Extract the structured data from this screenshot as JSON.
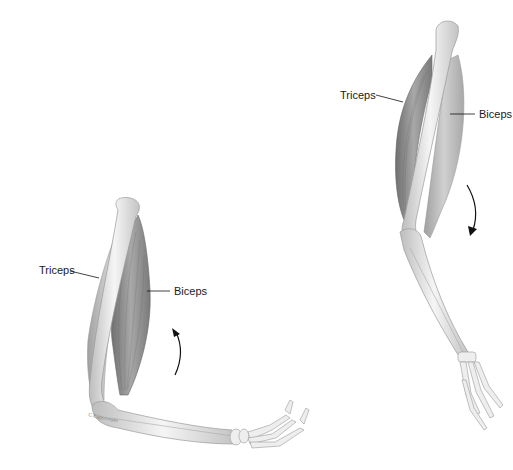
{
  "figure": {
    "left_panel": {
      "state": "flexed",
      "labels": {
        "triceps": "Triceps",
        "biceps": "Biceps"
      },
      "arrow_direction": "up",
      "signature": "C.Eggemeyer"
    },
    "right_panel": {
      "state": "extended",
      "labels": {
        "triceps": "Triceps",
        "biceps": "Biceps"
      },
      "arrow_direction": "down"
    }
  },
  "colors": {
    "bone": "#ececec",
    "bone_outline": "#9a9a9a",
    "muscle": "#8c8c8c",
    "muscle_light": "#b5b5b5",
    "text": "#1a1a1a"
  }
}
